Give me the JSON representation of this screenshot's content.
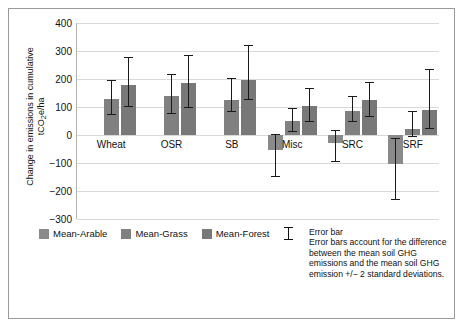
{
  "chart_data": {
    "type": "bar",
    "title": "",
    "subtitle": "",
    "xlabel": "",
    "ylabel": "Change in emissions in cumulative tCO2e/ha",
    "ylabel_line1": "Change in emissions in cumulative",
    "ylabel_line2_pre": "tCO",
    "ylabel_line2_sub": "2",
    "ylabel_line2_post": "e/ha",
    "ylim": [
      -300,
      400
    ],
    "yticks": [
      400,
      300,
      200,
      100,
      0,
      -100,
      -200,
      -300
    ],
    "ytick_labels": [
      "400",
      "300",
      "200",
      "100",
      "0",
      "−100",
      "−200",
      "−300"
    ],
    "grid": true,
    "legend_position": "below-left",
    "categories": [
      "Wheat",
      "OSR",
      "SB",
      "Misc",
      "SRC",
      "SRF"
    ],
    "series": [
      {
        "name": "Mean-Arable",
        "color": "#8a8a8a",
        "values": [
          null,
          null,
          null,
          -55,
          -28,
          -105
        ],
        "err_low": [
          null,
          null,
          null,
          -150,
          -95,
          -232
        ],
        "err_high": [
          null,
          null,
          null,
          5,
          18,
          -10
        ]
      },
      {
        "name": "Mean-Grass",
        "color": "#808080",
        "values": [
          128,
          138,
          125,
          50,
          85,
          20
        ],
        "err_low": [
          72,
          75,
          82,
          10,
          45,
          -8
        ],
        "err_high": [
          195,
          218,
          203,
          95,
          140,
          85
        ]
      },
      {
        "name": "Mean-Forest",
        "color": "#787878",
        "values": [
          180,
          185,
          198,
          105,
          125,
          90
        ],
        "err_low": [
          100,
          98,
          125,
          48,
          65,
          22
        ],
        "err_high": [
          280,
          285,
          320,
          168,
          190,
          235
        ]
      }
    ]
  },
  "legend": {
    "items": [
      {
        "label": "Mean-Arable",
        "color": "#8a8a8a"
      },
      {
        "label": "Mean-Grass",
        "color": "#808080"
      },
      {
        "label": "Mean-Forest",
        "color": "#787878"
      }
    ],
    "error_bar_label": "Error bar"
  },
  "note": {
    "heading": "Error bar",
    "body": "Error bars account for the difference between the mean soil GHG emissions and the mean soil GHG emission +/− 2 standard deviations."
  }
}
